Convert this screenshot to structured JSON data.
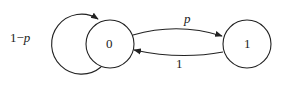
{
  "diagram": {
    "type": "markov-chain",
    "nodes": [
      {
        "id": "0",
        "label": "0"
      },
      {
        "id": "1",
        "label": "1"
      }
    ],
    "edges": [
      {
        "from": "0",
        "to": "0",
        "label": "1−p",
        "label_prefix": "1−",
        "label_var": "p"
      },
      {
        "from": "0",
        "to": "1",
        "label": "p"
      },
      {
        "from": "1",
        "to": "0",
        "label": "1"
      }
    ]
  }
}
